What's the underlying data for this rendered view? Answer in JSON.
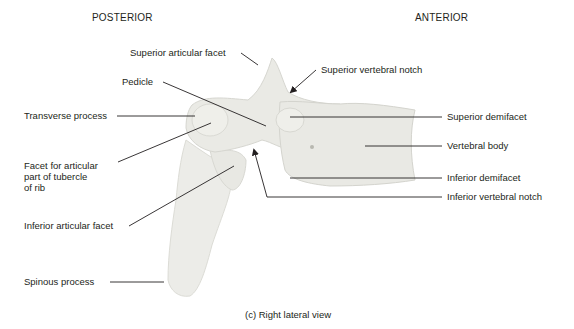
{
  "figure": {
    "orientation": {
      "left": "POSTERIOR",
      "right": "ANTERIOR"
    },
    "caption": "(c) Right lateral view",
    "colors": {
      "bone": "#e9e9e4",
      "bone_shade": "#d4d4ce",
      "line": "#231f20",
      "background": "#ffffff"
    },
    "labels": {
      "superior_articular_facet": "Superior articular facet",
      "pedicle": "Pedicle",
      "transverse_process": "Transverse process",
      "facet_tubercle_1": "Facet for articular",
      "facet_tubercle_2": "part of tubercle",
      "facet_tubercle_3": "of rib",
      "inferior_articular_facet": "Inferior articular facet",
      "spinous_process": "Spinous process",
      "superior_vertebral_notch": "Superior vertebral notch",
      "superior_demifacet": "Superior demifacet",
      "vertebral_body": "Vertebral body",
      "inferior_demifacet": "Inferior demifacet",
      "inferior_vertebral_notch": "Inferior vertebral notch"
    }
  }
}
